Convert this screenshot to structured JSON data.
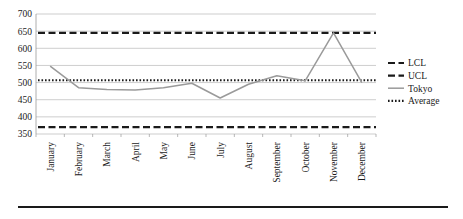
{
  "chart_data": {
    "type": "line",
    "title": "",
    "subtitle": "",
    "xlabel": "",
    "ylabel": "",
    "categories": [
      "January",
      "February",
      "March",
      "April",
      "May",
      "June",
      "July",
      "August",
      "September",
      "October",
      "November",
      "December"
    ],
    "ylim": [
      350,
      700
    ],
    "ytick_values": [
      350,
      400,
      450,
      500,
      550,
      600,
      650,
      700
    ],
    "ytick_labels": [
      "350",
      "400",
      "450",
      "500",
      "550",
      "600",
      "650",
      "700"
    ],
    "grid": true,
    "grid_axis": "y",
    "legend_position": "right",
    "series": [
      {
        "name": "LCL",
        "style": "dashed",
        "color": "#1a1a1a",
        "constant": true,
        "value": 370,
        "values": [
          370,
          370,
          370,
          370,
          370,
          370,
          370,
          370,
          370,
          370,
          370,
          370
        ]
      },
      {
        "name": "UCL",
        "style": "dashed",
        "color": "#1a1a1a",
        "constant": true,
        "value": 645,
        "values": [
          645,
          645,
          645,
          645,
          645,
          645,
          645,
          645,
          645,
          645,
          645,
          645
        ]
      },
      {
        "name": "Tokyo",
        "style": "solid",
        "color": "#9a9a9a",
        "constant": false,
        "values": [
          548,
          485,
          480,
          478,
          485,
          498,
          455,
          495,
          520,
          505,
          645,
          500
        ]
      },
      {
        "name": "Average",
        "style": "dotted",
        "color": "#1a1a1a",
        "constant": true,
        "value": 507,
        "values": [
          507,
          507,
          507,
          507,
          507,
          507,
          507,
          507,
          507,
          507,
          507,
          507
        ]
      }
    ]
  },
  "legend": {
    "entries": [
      {
        "label": "LCL"
      },
      {
        "label": "UCL"
      },
      {
        "label": "Tokyo"
      },
      {
        "label": "Average"
      }
    ]
  }
}
